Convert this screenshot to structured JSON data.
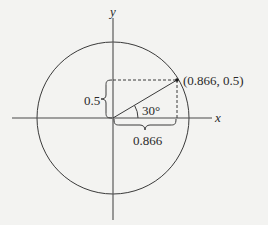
{
  "diagram": {
    "type": "unit-circle",
    "axes": {
      "x_label": "x",
      "y_label": "y"
    },
    "point": {
      "label": "(0.866, 0.5)",
      "x": 0.866,
      "y": 0.5
    },
    "angle": {
      "label": "30°",
      "degrees": 30
    },
    "vertical_leg": {
      "label": "0.5"
    },
    "horizontal_leg": {
      "label": "0.866"
    },
    "colors": {
      "background": "#f3f3f1",
      "stroke": "#3a3a3a",
      "text": "#2a2a2a"
    }
  }
}
